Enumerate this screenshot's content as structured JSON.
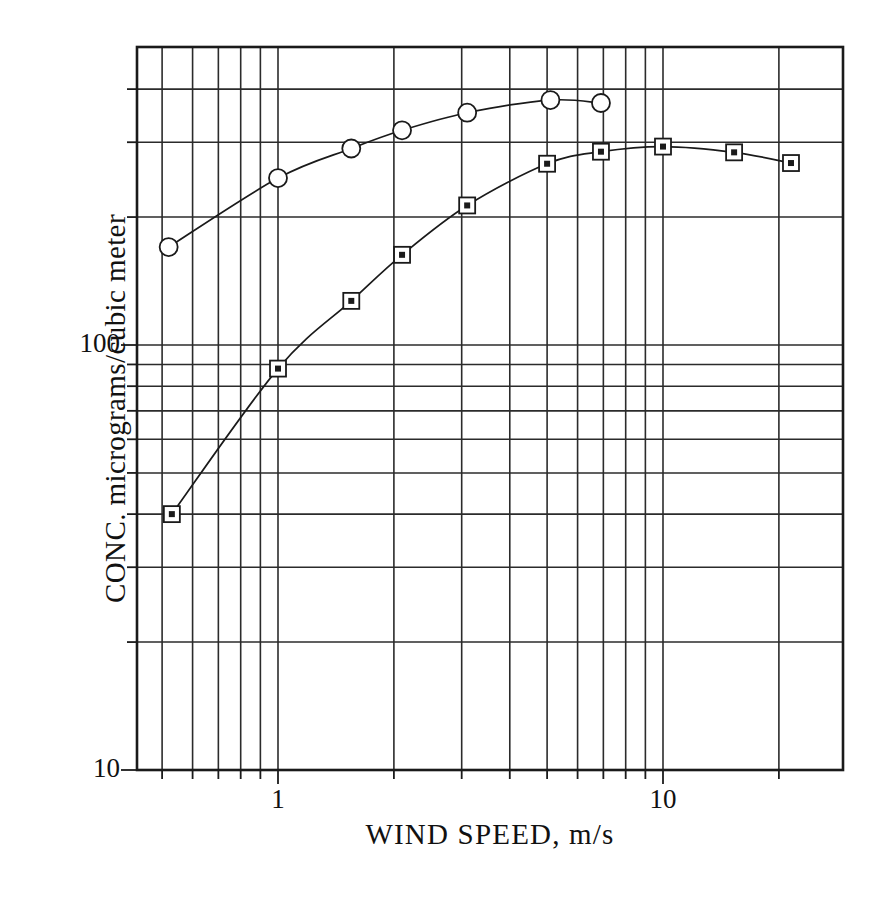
{
  "chart_data": {
    "type": "line",
    "title": "",
    "xlabel": "WIND SPEED,  m/s",
    "ylabel": "CONC. micrograms/cubic meter",
    "xscale": "log",
    "yscale": "log",
    "xlim": [
      0.5,
      22.0
    ],
    "ylim": [
      10,
      460
    ],
    "grid": true,
    "legend": false,
    "x_tick_labels": [
      "1",
      "10"
    ],
    "x_tick_values": [
      1,
      10
    ],
    "y_tick_labels": [
      "10",
      "100"
    ],
    "y_tick_values": [
      10,
      100
    ],
    "x_gridlines": [
      0.5,
      0.6,
      0.7,
      0.8,
      0.9,
      1,
      2,
      3,
      4,
      5,
      6,
      7,
      8,
      9,
      10,
      20
    ],
    "y_gridlines": [
      10,
      20,
      30,
      40,
      50,
      60,
      70,
      80,
      90,
      100,
      200,
      300,
      400
    ],
    "series": [
      {
        "name": "circle-series",
        "marker": "circle",
        "points": [
          {
            "x": 0.52,
            "y": 170
          },
          {
            "x": 1.0,
            "y": 247
          },
          {
            "x": 1.55,
            "y": 290
          },
          {
            "x": 2.1,
            "y": 320
          },
          {
            "x": 3.1,
            "y": 352
          },
          {
            "x": 5.1,
            "y": 377
          },
          {
            "x": 6.9,
            "y": 371
          }
        ]
      },
      {
        "name": "square-series",
        "marker": "square",
        "points": [
          {
            "x": 0.53,
            "y": 40
          },
          {
            "x": 1.0,
            "y": 88
          },
          {
            "x": 1.55,
            "y": 127
          },
          {
            "x": 2.1,
            "y": 163
          },
          {
            "x": 3.1,
            "y": 213
          },
          {
            "x": 5.0,
            "y": 267
          },
          {
            "x": 6.9,
            "y": 285
          },
          {
            "x": 10.0,
            "y": 293
          },
          {
            "x": 15.3,
            "y": 284
          },
          {
            "x": 21.5,
            "y": 268
          }
        ]
      }
    ]
  },
  "axis": {
    "x_label_1": "1",
    "x_label_10": "10",
    "y_label_10": "10",
    "y_label_100": "100"
  }
}
